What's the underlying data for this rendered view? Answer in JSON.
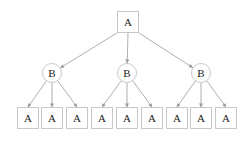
{
  "diagram": {
    "type": "tree",
    "edge_color": "#9a9a9a",
    "node_border_color": "#c8c8c8",
    "root": {
      "label": "A",
      "shape": "square",
      "cx": 128,
      "cy": 22,
      "size": 22
    },
    "level1": [
      {
        "label": "B",
        "shape": "circle",
        "cx": 52,
        "cy": 73,
        "r": 10
      },
      {
        "label": "B",
        "shape": "circle",
        "cx": 127,
        "cy": 73,
        "r": 10
      },
      {
        "label": "B",
        "shape": "circle",
        "cx": 201,
        "cy": 73,
        "r": 10
      }
    ],
    "leaves": [
      {
        "label": "A",
        "parent": 0,
        "cx": 28
      },
      {
        "label": "A",
        "parent": 0,
        "cx": 52
      },
      {
        "label": "A",
        "parent": 0,
        "cx": 77
      },
      {
        "label": "A",
        "parent": 1,
        "cx": 102
      },
      {
        "label": "A",
        "parent": 1,
        "cx": 127
      },
      {
        "label": "A",
        "parent": 1,
        "cx": 152
      },
      {
        "label": "A",
        "parent": 2,
        "cx": 177
      },
      {
        "label": "A",
        "parent": 2,
        "cx": 201
      },
      {
        "label": "A",
        "parent": 2,
        "cx": 226
      }
    ],
    "leaf_cy": 118,
    "leaf_size": 22
  }
}
